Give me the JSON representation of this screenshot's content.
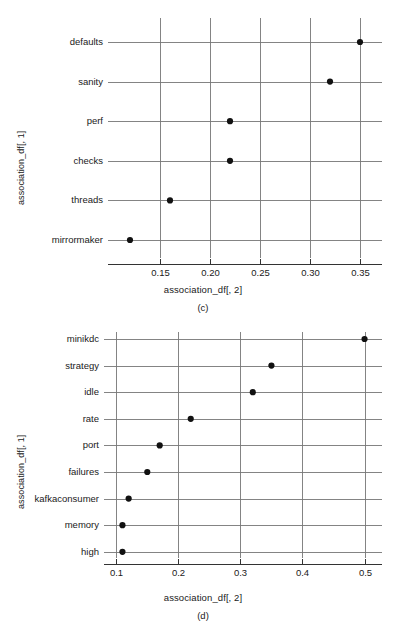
{
  "chart_data": [
    {
      "id": "c",
      "type": "scatter",
      "caption": "(c)",
      "title": "",
      "xlabel": "association_df[, 2]",
      "ylabel": "association_df[, 1]",
      "categories": [
        "defaults",
        "sanity",
        "perf",
        "checks",
        "threads",
        "mirrormaker"
      ],
      "values": [
        0.35,
        0.32,
        0.22,
        0.22,
        0.16,
        0.12
      ],
      "xticks": [
        0.15,
        0.2,
        0.25,
        0.3,
        0.35
      ],
      "xtick_labels": [
        "0.15",
        "0.20",
        "0.25",
        "0.30",
        "0.35"
      ],
      "xlim": [
        0.112,
        0.363
      ],
      "grid": true,
      "legend": null
    },
    {
      "id": "d",
      "type": "scatter",
      "caption": "(d)",
      "title": "",
      "xlabel": "association_df[, 2]",
      "ylabel": "association_df[, 1]",
      "categories": [
        "minikdc",
        "strategy",
        "idle",
        "rate",
        "port",
        "failures",
        "kafkaconsumer",
        "memory",
        "high"
      ],
      "values": [
        0.5,
        0.35,
        0.32,
        0.22,
        0.17,
        0.15,
        0.12,
        0.11,
        0.11
      ],
      "xticks": [
        0.1,
        0.2,
        0.3,
        0.4,
        0.5
      ],
      "xtick_labels": [
        "0.1",
        "0.2",
        "0.3",
        "0.4",
        "0.5"
      ],
      "xlim": [
        0.098,
        0.512
      ],
      "grid": true,
      "legend": null
    }
  ]
}
